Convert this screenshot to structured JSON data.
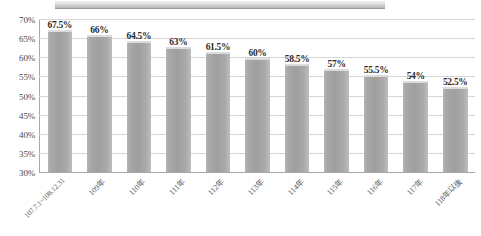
{
  "chart_data": {
    "type": "bar",
    "title": "",
    "subtitle": "",
    "xlabel": "",
    "ylabel": "",
    "ylim": [
      30,
      70
    ],
    "ytick_labels": [
      "70%",
      "65%",
      "60%",
      "55%",
      "50%",
      "45%",
      "40%",
      "35%",
      "30%"
    ],
    "ytick_values": [
      70,
      65,
      60,
      55,
      50,
      45,
      40,
      35,
      30
    ],
    "grid": true,
    "legend": "none",
    "categories": [
      "107.7.1~108.12.31",
      "109年",
      "110年",
      "111年",
      "112年",
      "113年",
      "114年",
      "115年",
      "116年",
      "117年",
      "118年以後"
    ],
    "values": [
      67.5,
      66,
      64.5,
      63,
      61.5,
      60,
      58.5,
      57,
      55.5,
      54,
      52.5
    ],
    "data_labels": [
      "67.5%",
      "66%",
      "64.5%",
      "63%",
      "61.5%",
      "60%",
      "58.5%",
      "57%",
      "55.5%",
      "54%",
      "52.5%"
    ],
    "bar_color": "#a3a3a3",
    "bar_highlight_color": "#dcdcdc",
    "gridline_color": "#d6d6d6",
    "axis_color": "#a8a8a8",
    "label_text_color": "#2b2b2b"
  },
  "top_band": {
    "fill_color": "#cfcfcf",
    "border_color": "#9a9a9a"
  }
}
